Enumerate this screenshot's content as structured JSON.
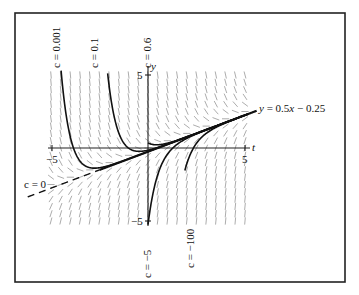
{
  "chart_data": {
    "type": "line",
    "title": "",
    "xlabel": "t",
    "ylabel": "y",
    "xlim": [
      -5,
      5
    ],
    "ylim": [
      -5,
      5
    ],
    "x_ticks": [
      "-5",
      "5"
    ],
    "y_ticks": [
      "5",
      "-5"
    ],
    "grid": false,
    "direction_field": true,
    "equation_family": "y = 0.5t - 0.25 + c*e^(-2t)",
    "asymptote_label": "y = 0.5x − 0.25",
    "series": [
      {
        "name": "c = 0.001",
        "c": 0.001,
        "label": "c = 0.001"
      },
      {
        "name": "c = 0.1",
        "c": 0.1,
        "label": "c = 0.1"
      },
      {
        "name": "c = 0.6",
        "c": 0.6,
        "label": "c = 0.6"
      },
      {
        "name": "c = 0",
        "c": 0,
        "label": "c = 0"
      },
      {
        "name": "c = −5",
        "c": -5,
        "label": "c = −5"
      },
      {
        "name": "c = −100",
        "c": -100,
        "label": "c = −100"
      }
    ]
  },
  "labels": {
    "t_axis": "t",
    "y_axis": "y",
    "tick_x_neg5": "−5",
    "tick_x_5": "5",
    "tick_y_5": "5",
    "tick_y_neg5": "−5",
    "asymptote": "y = 0.5x − 0.25",
    "c0001": "c = 0.001",
    "c01": "c = 0.1",
    "c06": "c = 0.6",
    "c0": "c = 0",
    "cm5": "c = −5",
    "cm100": "c = −100"
  }
}
